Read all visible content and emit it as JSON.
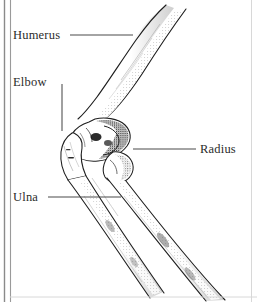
{
  "figure": {
    "kind": "anatomical-line-drawing",
    "style": "pen-and-ink stipple engraving",
    "background_color": "#ffffff",
    "ink_color": "#1e1e1e",
    "leader_line_color": "#4a4a4a",
    "label_text_color": "#2b2b2b"
  },
  "frame": {
    "left_rule_outer_color": "#8a8a8a",
    "left_rule_inner_color": "#9a9a9a",
    "right_rule_color": "#d8d8d8",
    "bottom_rule_color": "#d8d8d8"
  },
  "labels": [
    {
      "id": "humerus",
      "text": "Humerus",
      "leader": {
        "type": "horizontal",
        "x1": 70,
        "y1": 35,
        "x2": 133,
        "y2": 35
      }
    },
    {
      "id": "elbow",
      "text": "Elbow",
      "leader": {
        "type": "vertical",
        "x1": 62,
        "y1": 84,
        "x2": 62,
        "y2": 131
      }
    },
    {
      "id": "radius",
      "text": "Radius",
      "leader": {
        "type": "horizontal",
        "x1": 133,
        "y1": 149,
        "x2": 196,
        "y2": 149
      }
    },
    {
      "id": "ulna",
      "text": "Ulna",
      "leader": {
        "type": "horizontal",
        "x1": 48,
        "y1": 197,
        "x2": 121,
        "y2": 197
      }
    }
  ],
  "bones": [
    {
      "id": "humerus-shaft",
      "name": "Humerus"
    },
    {
      "id": "olecranon",
      "name": "Olecranon process"
    },
    {
      "id": "ulna-shaft",
      "name": "Ulna"
    },
    {
      "id": "radius-shaft",
      "name": "Radius"
    }
  ]
}
